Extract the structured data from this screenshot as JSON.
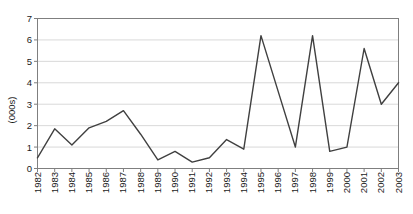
{
  "chart_data": {
    "type": "line",
    "title": "",
    "xlabel": "",
    "ylabel": "(000s)",
    "categories": [
      "1982",
      "1983",
      "1984",
      "1985",
      "1986",
      "1987",
      "1988",
      "1989",
      "1990",
      "1991",
      "1992",
      "1993",
      "1994",
      "1995",
      "1996",
      "1997",
      "1998",
      "1999",
      "2000",
      "2001",
      "2002",
      "2003"
    ],
    "values": [
      0.5,
      1.85,
      1.1,
      1.9,
      2.2,
      2.7,
      1.6,
      0.4,
      0.8,
      0.3,
      0.5,
      1.35,
      0.9,
      6.2,
      3.6,
      1.0,
      6.2,
      0.8,
      1.0,
      5.6,
      3.0,
      4.0
    ],
    "ylim": [
      0,
      7
    ],
    "yticks": [
      0,
      1,
      2,
      3,
      4,
      5,
      6,
      7
    ],
    "grid": "horizontal",
    "legend": "none",
    "x_label_rotation": -90,
    "colors": {
      "line": "#404040",
      "grid": "#d9d9d9",
      "axis": "#7f7f7f",
      "label": "#1a1a1a",
      "background": "#ffffff"
    }
  }
}
